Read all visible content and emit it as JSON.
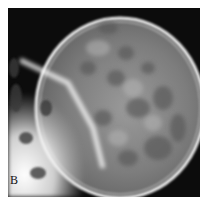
{
  "figure": {
    "panel_label": "B",
    "colors": {
      "background": "#0c0c0c",
      "bone": "#e6e6e6",
      "vault": "#8a8a8a",
      "margin": "#ffffff"
    }
  }
}
